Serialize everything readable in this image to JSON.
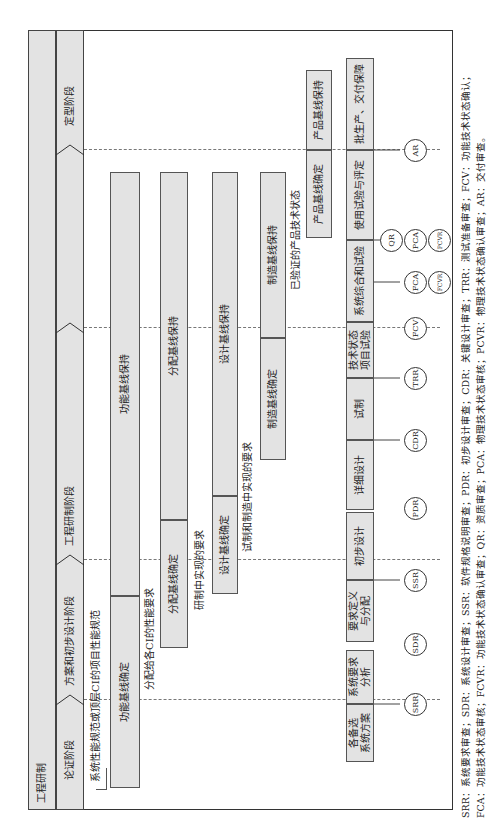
{
  "diagram": {
    "type": "engineering-development-lifecycle",
    "orientation": "rotated-90-ccw",
    "top_band": {
      "label": "工程研制"
    },
    "phases": [
      {
        "id": "p1",
        "label": "论证阶段"
      },
      {
        "id": "p2",
        "label": "方案和初步设计阶段"
      },
      {
        "id": "p3",
        "label": "工程研制阶段"
      },
      {
        "id": "p4",
        "label": "定型阶段"
      }
    ],
    "baselines": [
      {
        "row": 1,
        "establish": "功能基线确定",
        "maintain": "功能基线保持"
      },
      {
        "row": 2,
        "establish": "分配基线确定",
        "maintain": "分配基线保持"
      },
      {
        "row": 3,
        "establish": "设计基线确定",
        "maintain": "设计基线保持"
      },
      {
        "row": 4,
        "establish": "制造基线确定",
        "maintain": "制造基线保持"
      },
      {
        "row": 5,
        "establish": "产品基线确定",
        "maintain": "产品基线保持"
      }
    ],
    "flow_labels": [
      "系统性能规范或顶层CI的项目性能规范",
      "分配给各CI的性能要求",
      "研制中实现的要求",
      "试制和制造中实现的要求",
      "已验证的产品技术状态"
    ],
    "activities": [
      {
        "label_line1": "各备选",
        "label_line2": "系统方案"
      },
      {
        "label_line1": "系统要求",
        "label_line2": "分析"
      },
      {
        "label_line1": "要求定义",
        "label_line2": "与分配"
      },
      {
        "label_line1": "初步设计",
        "label_line2": ""
      },
      {
        "label_line1": "详细设计",
        "label_line2": ""
      },
      {
        "label_line1": "试制",
        "label_line2": ""
      },
      {
        "label_line1": "技术状态",
        "label_line2": "项目试验"
      },
      {
        "label_line1": "系统综合和试验",
        "label_line2": ""
      },
      {
        "label_line1": "使用试验与评定",
        "label_line2": ""
      },
      {
        "label_line1": "批生产、交付保障",
        "label_line2": ""
      }
    ],
    "reviews": [
      "SRR",
      "SDR",
      "SSR",
      "PDR",
      "CDR",
      "TRR",
      "FCV",
      "FCA",
      "FCVR",
      "QR",
      "PCA",
      "PCVR",
      "AR"
    ],
    "legend": {
      "line1": "SRR：系统要求审查；SDR：系统设计审查；SSR：软件规格说明审查；PDR：初步设计审查；CDR：关键设计审查；TRR：测试准备审查；FCV：功能技术状态确认；",
      "line2": "FCA：功能技术状态审核；FCVR：功能技术状态确认审查；QR：资质审查；PCA：物理技术状态审核；PCVR：物理技术状态确认审查；AR：交付审查。"
    }
  }
}
